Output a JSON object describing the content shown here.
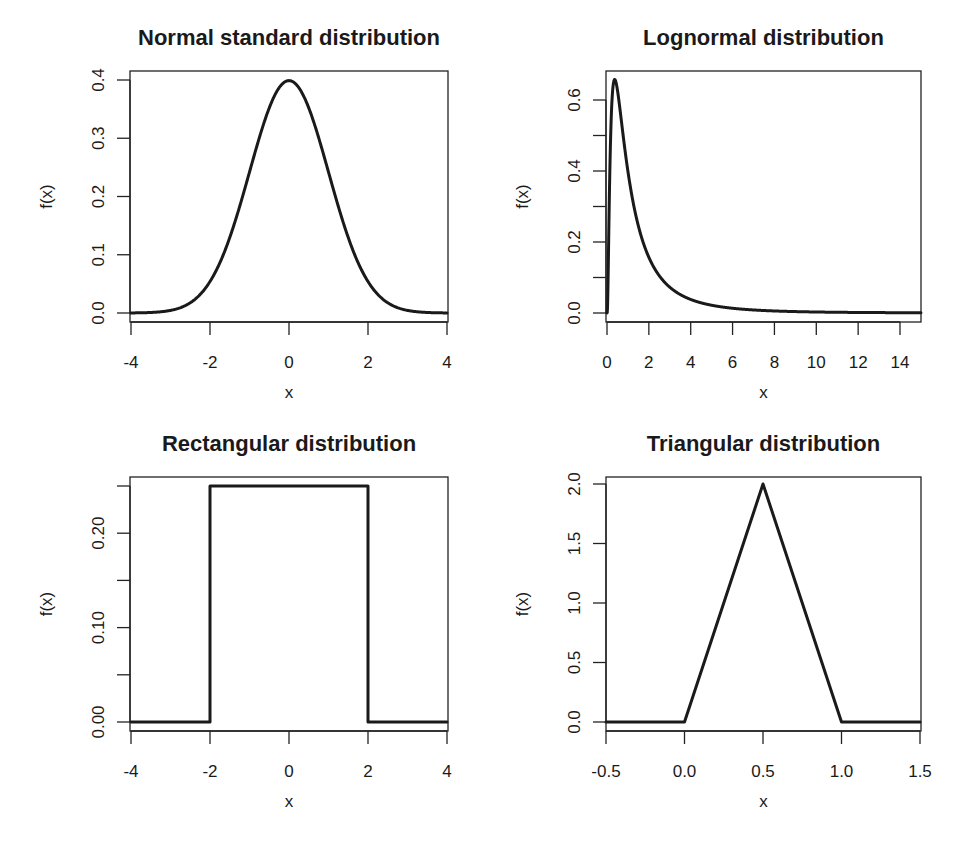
{
  "chart_data": [
    {
      "id": "normal",
      "type": "line",
      "title": "Normal standard distribution",
      "xlabel": "x",
      "ylabel": "f(x)",
      "xlim": [
        -4,
        4
      ],
      "ylim": [
        0,
        0.4
      ],
      "grid": false,
      "legend": null,
      "x_ticks": [
        -4,
        -2,
        0,
        2,
        4
      ],
      "x_tick_labels": [
        "-4",
        "-2",
        "0",
        "2",
        "4"
      ],
      "y_ticks": [
        0.0,
        0.1,
        0.2,
        0.3,
        0.4
      ],
      "y_tick_labels": [
        "0.0",
        "0.1",
        "0.2",
        "0.3",
        "0.4"
      ],
      "function": "dnorm(x, 0, 1)",
      "x": [
        -4,
        -3.5,
        -3,
        -2.5,
        -2,
        -1.5,
        -1,
        -0.5,
        0,
        0.5,
        1,
        1.5,
        2,
        2.5,
        3,
        3.5,
        4
      ],
      "y": [
        0.0001,
        0.0009,
        0.0044,
        0.0175,
        0.054,
        0.1295,
        0.242,
        0.3521,
        0.3989,
        0.3521,
        0.242,
        0.1295,
        0.054,
        0.0175,
        0.0044,
        0.0009,
        0.0001
      ],
      "pixel_box": {
        "left": 130,
        "right": 448,
        "top": 71,
        "bottom": 322
      },
      "pixel_map": {
        "x0": 131,
        "x1": 447,
        "xv0": -4,
        "xv1": 4,
        "y0": 313,
        "y1": 80,
        "yv0": 0,
        "yv1": 0.4
      }
    },
    {
      "id": "lognormal",
      "type": "line",
      "title": "Lognormal distribution",
      "xlabel": "x",
      "ylabel": "f(x)",
      "xlim": [
        0,
        15
      ],
      "ylim": [
        0,
        0.66
      ],
      "grid": false,
      "legend": null,
      "x_ticks": [
        0,
        2,
        4,
        6,
        8,
        10,
        12,
        14
      ],
      "x_tick_labels": [
        "0",
        "2",
        "4",
        "6",
        "8",
        "10",
        "12",
        "14"
      ],
      "y_ticks": [
        0.0,
        0.1,
        0.2,
        0.3,
        0.4,
        0.5,
        0.6
      ],
      "y_tick_labels": [
        "0.0",
        "",
        "0.2",
        "",
        "0.4",
        "",
        "0.6"
      ],
      "function": "dlnorm(x, 0, 1)",
      "x": [
        0,
        0.1,
        0.2,
        0.368,
        0.5,
        1,
        1.5,
        2,
        3,
        4,
        5,
        6,
        8,
        10,
        12,
        15
      ],
      "y": [
        0,
        0.2812,
        0.5462,
        0.6577,
        0.6275,
        0.3989,
        0.2447,
        0.1569,
        0.0727,
        0.036,
        0.022,
        0.0135,
        0.0058,
        0.0028,
        0.0015,
        0.0007
      ],
      "pixel_box": {
        "left": 606,
        "right": 921,
        "top": 71,
        "bottom": 322
      },
      "pixel_map": {
        "x0": 607,
        "x1": 900,
        "xv0": 0,
        "xv1": 14,
        "y0": 313,
        "y1": 100,
        "yv0": 0,
        "yv1": 0.6
      }
    },
    {
      "id": "rectangular",
      "type": "line",
      "title": "Rectangular distribution",
      "xlabel": "x",
      "ylabel": "f(x)",
      "xlim": [
        -4,
        4
      ],
      "ylim": [
        0,
        0.25
      ],
      "grid": false,
      "legend": null,
      "x_ticks": [
        -4,
        -2,
        0,
        2,
        4
      ],
      "x_tick_labels": [
        "-4",
        "-2",
        "0",
        "2",
        "4"
      ],
      "y_ticks": [
        0.0,
        0.05,
        0.1,
        0.15,
        0.2,
        0.25
      ],
      "y_tick_labels": [
        "0.00",
        "",
        "0.10",
        "",
        "0.20",
        ""
      ],
      "function": "dunif(x, -2, 2)",
      "x": [
        -4,
        -2,
        -2,
        2,
        2,
        4
      ],
      "y": [
        0,
        0,
        0.25,
        0.25,
        0,
        0
      ],
      "pixel_box": {
        "left": 130,
        "right": 448,
        "top": 477,
        "bottom": 731
      },
      "pixel_map": {
        "x0": 131,
        "x1": 447,
        "xv0": -4,
        "xv1": 4,
        "y0": 722,
        "y1": 486,
        "yv0": 0,
        "yv1": 0.25
      }
    },
    {
      "id": "triangular",
      "type": "line",
      "title": "Triangular distribution",
      "xlabel": "x",
      "ylabel": "f(x)",
      "xlim": [
        -0.5,
        1.5
      ],
      "ylim": [
        0,
        2.0
      ],
      "grid": false,
      "legend": null,
      "x_ticks": [
        -0.5,
        0.0,
        0.5,
        1.0,
        1.5
      ],
      "x_tick_labels": [
        "-0.5",
        "0.0",
        "0.5",
        "1.0",
        "1.5"
      ],
      "y_ticks": [
        0.0,
        0.5,
        1.0,
        1.5,
        2.0
      ],
      "y_tick_labels": [
        "0.0",
        "0.5",
        "1.0",
        "1.5",
        "2.0"
      ],
      "function": "triangular(a=0, c=0.5, b=1)",
      "x": [
        -0.5,
        0,
        0.5,
        1,
        1.5
      ],
      "y": [
        0,
        0,
        2,
        0,
        0
      ],
      "pixel_box": {
        "left": 606,
        "right": 921,
        "top": 477,
        "bottom": 731
      },
      "pixel_map": {
        "x0": 606,
        "x1": 920,
        "xv0": -0.5,
        "xv1": 1.5,
        "y0": 722,
        "y1": 484,
        "yv0": 0,
        "yv1": 2.0
      }
    }
  ]
}
